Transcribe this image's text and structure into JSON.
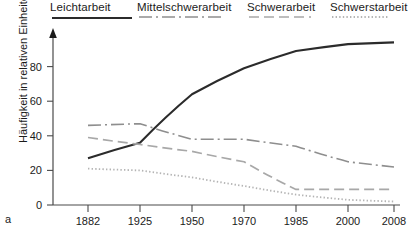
{
  "figure": {
    "panel_label": "a",
    "ylabel": "Häufigkeit in relativen Einheiten"
  },
  "legend": {
    "items": [
      {
        "label": "Leichtarbeit",
        "style": "solid",
        "color": "#2b2b2b"
      },
      {
        "label": "Mittelschwerarbeit",
        "style": "dash-dot",
        "color": "#8e8e8e"
      },
      {
        "label": "Schwerarbeit",
        "style": "dashed",
        "color": "#a8a8a8"
      },
      {
        "label": "Schwerstarbeit",
        "style": "dotted",
        "color": "#b4b4b4"
      }
    ]
  },
  "chart_data": {
    "type": "line",
    "title": "",
    "xlabel": "",
    "ylabel": "Häufigkeit in relativen Einheiten",
    "categories": [
      "1882",
      "1925",
      "1950",
      "1970",
      "1985",
      "2000",
      "2008"
    ],
    "ylim": [
      0,
      100
    ],
    "yticks": [
      0,
      20,
      40,
      60,
      80
    ],
    "grid": false,
    "legend_position": "top",
    "series": [
      {
        "name": "Leichtarbeit",
        "style": "solid",
        "color": "#2b2b2b",
        "values": [
          27,
          36,
          64,
          79,
          89,
          93,
          94
        ]
      },
      {
        "name": "Mittelschwerarbeit",
        "style": "dash-dot",
        "color": "#8e8e8e",
        "values": [
          46,
          47,
          38,
          38,
          34,
          25,
          22
        ]
      },
      {
        "name": "Schwerarbeit",
        "style": "dashed",
        "color": "#a8a8a8",
        "values": [
          39,
          35,
          31,
          25,
          9,
          9,
          9
        ]
      },
      {
        "name": "Schwerstarbeit",
        "style": "dotted",
        "color": "#b4b4b4",
        "values": [
          21,
          20,
          16,
          11,
          6,
          3,
          2
        ]
      }
    ]
  }
}
